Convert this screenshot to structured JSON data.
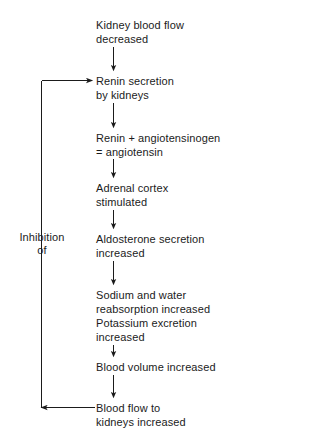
{
  "diagram": {
    "background_color": "#ffffff",
    "line_color": "#1b1b1b",
    "text_color": "#1b1b1b",
    "nodes": [
      {
        "id": "kidney-blood-flow",
        "lines": [
          "Kidney blood flow",
          "decreased"
        ],
        "text": "Kidney blood flow\ndecreased",
        "x": 96,
        "y": 18
      },
      {
        "id": "renin-secretion",
        "lines": [
          "Renin secretion",
          "by kidneys"
        ],
        "text": "Renin secretion\nby kidneys",
        "x": 96,
        "y": 74
      },
      {
        "id": "renin-angiotensinogen",
        "lines": [
          "Renin + angiotensinogen",
          "= angiotensin"
        ],
        "text": "Renin + angiotensinogen\n= angiotensin",
        "x": 96,
        "y": 131
      },
      {
        "id": "adrenal-cortex",
        "lines": [
          "Adrenal cortex",
          "stimulated"
        ],
        "text": "Adrenal cortex\nstimulated",
        "x": 96,
        "y": 181
      },
      {
        "id": "aldosterone-secretion",
        "lines": [
          "Aldosterone secretion",
          "increased"
        ],
        "text": "Aldosterone secretion\nincreased",
        "x": 96,
        "y": 232
      },
      {
        "id": "sodium-water-potassium",
        "lines": [
          "Sodium and water",
          "reabsorption increased",
          "Potassium excretion",
          "increased"
        ],
        "text": "Sodium and water\nreabsorption increased\nPotassium excretion\nincreased",
        "x": 96,
        "y": 288
      },
      {
        "id": "blood-volume",
        "lines": [
          "Blood volume increased"
        ],
        "text": "Blood volume increased",
        "x": 96,
        "y": 360
      },
      {
        "id": "blood-flow-kidneys",
        "lines": [
          "Blood flow to",
          "kidneys increased"
        ],
        "text": "Blood flow to\nkidneys increased",
        "x": 96,
        "y": 401
      }
    ],
    "loop_label": {
      "id": "inhibition-of",
      "lines": [
        "Inhibition",
        "of"
      ],
      "text": "Inhibition\nof"
    },
    "connector_arrows": [
      {
        "from": "kidney-blood-flow",
        "to": "renin-secretion",
        "direction": "down"
      },
      {
        "from": "renin-secretion",
        "to": "renin-angiotensinogen",
        "direction": "down"
      },
      {
        "from": "renin-angiotensinogen",
        "to": "adrenal-cortex",
        "direction": "down"
      },
      {
        "from": "adrenal-cortex",
        "to": "aldosterone-secretion",
        "direction": "down"
      },
      {
        "from": "aldosterone-secretion",
        "to": "sodium-water-potassium",
        "direction": "down"
      },
      {
        "from": "sodium-water-potassium",
        "to": "blood-volume",
        "direction": "down"
      },
      {
        "from": "blood-volume",
        "to": "blood-flow-kidneys",
        "direction": "down"
      }
    ],
    "feedback_loop": {
      "from": "blood-flow-kidneys",
      "to": "renin-secretion",
      "label": "Inhibition of",
      "direction": "counterclockwise"
    }
  }
}
